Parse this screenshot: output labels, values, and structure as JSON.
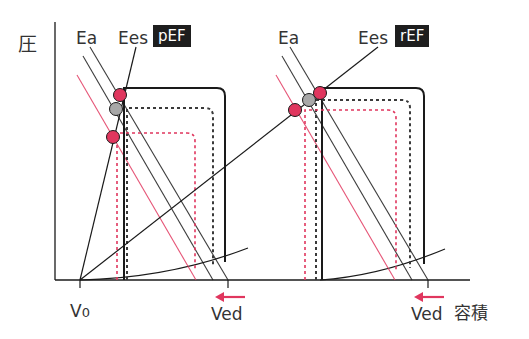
{
  "axes": {
    "y_label": "圧",
    "x_label": "容積",
    "origin": [
      55,
      280
    ],
    "y_top": 22,
    "x_right": 470
  },
  "colors": {
    "line": "#1a1a1a",
    "accent": "#e0365e",
    "gray_point": "#a8a8a8",
    "badge_bg": "#1e1e1e",
    "text": "#333333"
  },
  "v0": {
    "label": "V",
    "sub": "0",
    "x": 80
  },
  "panels": [
    {
      "name": "pEF",
      "badge": "pEF",
      "ea_label": "Ea",
      "ees_label": "Ees",
      "ved_label": "Ved",
      "ved_x": 228,
      "arrow": {
        "x1": 245,
        "x2": 215,
        "y": 297
      },
      "points": [
        {
          "type": "red",
          "cx": 120,
          "cy": 95
        },
        {
          "type": "gray",
          "cx": 116,
          "cy": 109
        },
        {
          "type": "red",
          "cx": 113,
          "cy": 137
        }
      ],
      "ees_line": {
        "x1": 80,
        "y1": 280,
        "x2": 136,
        "y2": 47
      },
      "ea_lines": [
        {
          "color": "dark",
          "x1": 90,
          "y1": 47,
          "x2": 228,
          "y2": 280
        },
        {
          "color": "dark",
          "x1": 83,
          "y1": 56,
          "x2": 213,
          "y2": 280
        },
        {
          "color": "red",
          "x1": 77,
          "y1": 75,
          "x2": 196,
          "y2": 280
        }
      ],
      "loops": [
        {
          "style": "solid",
          "x_left": 124,
          "x_right": 225,
          "y_top": 88,
          "y_bottom_left": 280,
          "y_bottom_right": 262
        },
        {
          "style": "dash-dark",
          "x_left": 127,
          "x_right": 213,
          "y_top": 108,
          "y_bottom_left": 280,
          "y_bottom_right": 266
        },
        {
          "style": "dash-red",
          "x_left": 117,
          "x_right": 195,
          "y_top": 133,
          "y_bottom_left": 280,
          "y_bottom_right": 271
        }
      ]
    },
    {
      "name": "rEF",
      "badge": "rEF",
      "ea_label": "Ea",
      "ees_label": "Ees",
      "ved_label": "Ved",
      "ved_x": 428,
      "arrow": {
        "x1": 444,
        "x2": 414,
        "y": 297
      },
      "points": [
        {
          "type": "red",
          "cx": 320,
          "cy": 93
        },
        {
          "type": "gray",
          "cx": 309,
          "cy": 100
        },
        {
          "type": "red",
          "cx": 295,
          "cy": 110
        }
      ],
      "ees_line": {
        "x1": 80,
        "y1": 280,
        "x2": 378,
        "y2": 47
      },
      "ea_lines": [
        {
          "color": "dark",
          "x1": 290,
          "y1": 47,
          "x2": 428,
          "y2": 280
        },
        {
          "color": "dark",
          "x1": 282,
          "y1": 56,
          "x2": 412,
          "y2": 280
        },
        {
          "color": "red",
          "x1": 276,
          "y1": 75,
          "x2": 395,
          "y2": 280
        }
      ],
      "loops": [
        {
          "style": "solid",
          "x_left": 322,
          "x_right": 424,
          "y_top": 88,
          "y_bottom_left": 280,
          "y_bottom_right": 264
        },
        {
          "style": "dash-dark",
          "x_left": 316,
          "x_right": 410,
          "y_top": 100,
          "y_bottom_left": 280,
          "y_bottom_right": 268
        },
        {
          "style": "dash-red",
          "x_left": 305,
          "x_right": 396,
          "y_top": 110,
          "y_bottom_left": 280,
          "y_bottom_right": 271
        }
      ]
    }
  ],
  "edpvr": {
    "left": {
      "x1": 80,
      "y1": 280,
      "cx": 170,
      "cy": 278,
      "x2": 248,
      "y2": 248
    },
    "right": {
      "x1": 320,
      "y1": 280,
      "cx": 380,
      "cy": 276,
      "x2": 445,
      "y2": 249
    }
  }
}
